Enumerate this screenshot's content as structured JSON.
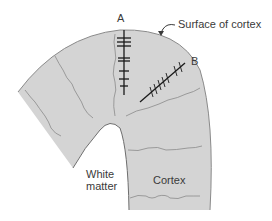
{
  "diagram": {
    "labels": {
      "electrode_a": "A",
      "electrode_b": "B",
      "surface": "Surface of cortex",
      "white_matter_line1": "White",
      "white_matter_line2": "matter",
      "cortex": "Cortex"
    },
    "colors": {
      "cortex_fill": "#d4d4d4",
      "outline": "#7a7a7a",
      "electrode": "#1a1a1a",
      "column_lines": "#8a8a8a",
      "text": "#3a3a3a"
    }
  }
}
